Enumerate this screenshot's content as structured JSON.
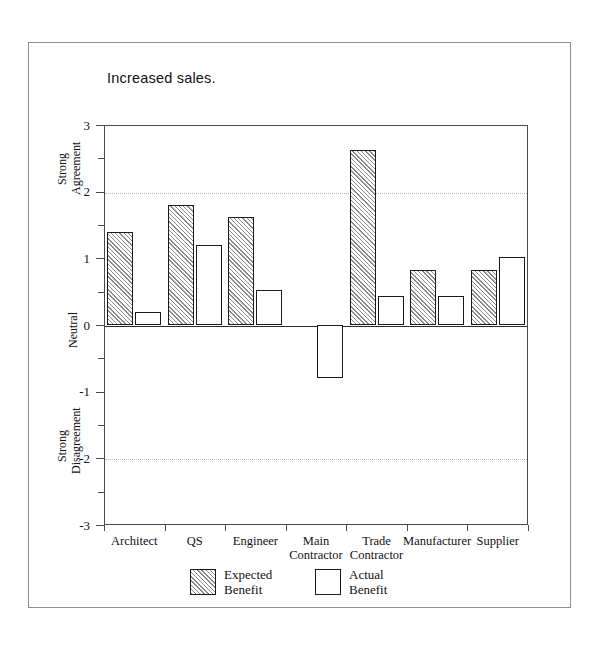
{
  "figure": {
    "title": "Increased sales."
  },
  "chart_data": {
    "type": "bar",
    "title": "Increased sales.",
    "xlabel": "",
    "ylabel": "",
    "ylim": [
      -3,
      3
    ],
    "grid": "dotted horizontal gridlines at 2 and -2",
    "legend_position": "bottom-center",
    "categories": [
      "Architect",
      "QS",
      "Engineer",
      "Main Contractor",
      "Trade Contractor",
      "Manufacturer",
      "Supplier"
    ],
    "category_lines": [
      [
        "Architect"
      ],
      [
        "QS"
      ],
      [
        "Engineer"
      ],
      [
        "Main",
        "Contractor"
      ],
      [
        "Trade",
        "Contractor"
      ],
      [
        "Manufacturer"
      ],
      [
        "Supplier"
      ]
    ],
    "series": [
      {
        "name": "Expected Benefit",
        "fill": "hatched",
        "values": [
          1.4,
          1.8,
          1.62,
          0,
          2.62,
          0.83,
          0.83
        ]
      },
      {
        "name": "Actual Benefit",
        "fill": "white",
        "values": [
          0.2,
          1.2,
          0.52,
          -0.8,
          0.43,
          0.43,
          1.02
        ]
      }
    ],
    "yticks": [
      3,
      2,
      1,
      0,
      -1,
      -2,
      -3
    ],
    "ytick_labels": [
      "3",
      "2",
      "1",
      "0",
      "-1",
      "-2",
      "-3"
    ],
    "y_scale_anchors": [
      {
        "value": 2.5,
        "label": "Strong Agreement",
        "lines": [
          "Strong",
          "Agreement"
        ]
      },
      {
        "value": 0,
        "label": "Neutral",
        "lines": [
          "Neutral"
        ]
      },
      {
        "value": -2.5,
        "label": "Strong Disagreement",
        "lines": [
          "Strong",
          "Disagreement"
        ]
      }
    ],
    "legend": [
      {
        "name": "Expected Benefit",
        "lines": [
          "Expected",
          "Benefit"
        ]
      },
      {
        "name": "Actual Benefit",
        "lines": [
          "Actual",
          "Benefit"
        ]
      }
    ],
    "colors": {
      "axis": "#2a2a2a",
      "grid": "#b4b4b4",
      "bar_edge": "#1a1a1a",
      "hatch": "#8a8a8a",
      "background": "#ffffff",
      "frame": "#8d8d8d"
    }
  }
}
